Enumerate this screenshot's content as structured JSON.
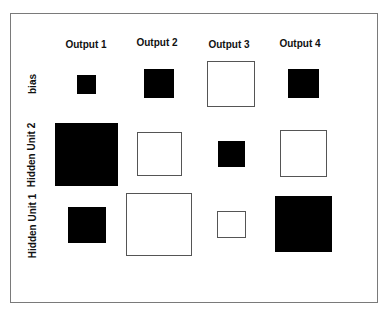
{
  "chart_data": {
    "type": "heatmap",
    "subtype": "hinton",
    "title": "",
    "columns": [
      "Output 1",
      "Output 2",
      "Output 3",
      "Output 4"
    ],
    "rows": [
      "bias",
      "Hidden Unit 2",
      "Hidden Unit 1"
    ],
    "encoding": "square side proportional to weight magnitude; filled black = negative, white outlined = positive",
    "values": [
      [
        -0.3,
        -0.47,
        0.72,
        -0.48
      ],
      [
        -1.0,
        0.7,
        -0.42,
        0.73
      ],
      [
        -0.58,
        1.0,
        0.44,
        -0.88
      ]
    ],
    "cells": [
      {
        "row": "bias",
        "col": "Output 1",
        "sign": "negative",
        "x": 77,
        "y": 75,
        "w": 19,
        "h": 19
      },
      {
        "row": "bias",
        "col": "Output 2",
        "sign": "negative",
        "x": 144,
        "y": 69,
        "w": 30,
        "h": 29
      },
      {
        "row": "bias",
        "col": "Output 3",
        "sign": "positive",
        "x": 207,
        "y": 61,
        "w": 48,
        "h": 46
      },
      {
        "row": "bias",
        "col": "Output 4",
        "sign": "negative",
        "x": 288,
        "y": 69,
        "w": 31,
        "h": 29
      },
      {
        "row": "Hidden Unit 2",
        "col": "Output 1",
        "sign": "negative",
        "x": 55,
        "y": 123,
        "w": 63,
        "h": 63
      },
      {
        "row": "Hidden Unit 2",
        "col": "Output 2",
        "sign": "positive",
        "x": 137,
        "y": 132,
        "w": 45,
        "h": 44
      },
      {
        "row": "Hidden Unit 2",
        "col": "Output 3",
        "sign": "negative",
        "x": 218,
        "y": 141,
        "w": 27,
        "h": 26
      },
      {
        "row": "Hidden Unit 2",
        "col": "Output 4",
        "sign": "positive",
        "x": 280,
        "y": 130,
        "w": 47,
        "h": 47
      },
      {
        "row": "Hidden Unit 1",
        "col": "Output 1",
        "sign": "negative",
        "x": 68,
        "y": 207,
        "w": 38,
        "h": 36
      },
      {
        "row": "Hidden Unit 1",
        "col": "Output 2",
        "sign": "positive",
        "x": 126,
        "y": 193,
        "w": 66,
        "h": 63
      },
      {
        "row": "Hidden Unit 1",
        "col": "Output 3",
        "sign": "positive",
        "x": 217,
        "y": 211,
        "w": 29,
        "h": 27
      },
      {
        "row": "Hidden Unit 1",
        "col": "Output 4",
        "sign": "negative",
        "x": 275,
        "y": 196,
        "w": 57,
        "h": 56
      }
    ],
    "grid": false,
    "legend": null
  },
  "labels": {
    "columns": [
      "Output 1",
      "Output 2",
      "Output 3",
      "Output 4"
    ],
    "rows": [
      "bias",
      "Hidden Unit 2",
      "Hidden Unit 1"
    ]
  },
  "colors": {
    "negative_fill": "#000000",
    "positive_fill": "#ffffff",
    "positive_border": "#555555",
    "frame_border": "#7a7a7a"
  }
}
